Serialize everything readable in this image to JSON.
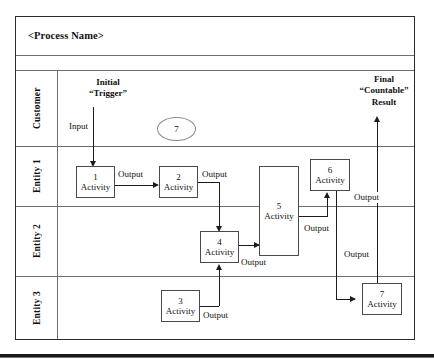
{
  "diagram": {
    "title": "<Process Name>",
    "type": "swimlane-process-flow"
  },
  "lanes": [
    {
      "id": "customer",
      "label": "Customer"
    },
    {
      "id": "entity1",
      "label": "Entity 1"
    },
    {
      "id": "entity2",
      "label": "Entity 2"
    },
    {
      "id": "entity3",
      "label": "Entity 3"
    }
  ],
  "annotations": {
    "initial_trigger_line1": "Initial",
    "initial_trigger_line2": "“Trigger”",
    "final_result_line1": "Final",
    "final_result_line2": "“Countable”",
    "final_result_line3": "Result",
    "input_label": "Input",
    "marker_seven": "7"
  },
  "activities": [
    {
      "id": "a1",
      "number": "1",
      "label": "Activity",
      "lane": "entity1"
    },
    {
      "id": "a2",
      "number": "2",
      "label": "Activity",
      "lane": "entity1"
    },
    {
      "id": "a3",
      "number": "3",
      "label": "Activity",
      "lane": "entity3"
    },
    {
      "id": "a4",
      "number": "4",
      "label": "Activity",
      "lane": "entity2"
    },
    {
      "id": "a5",
      "number": "5",
      "label": "Activity",
      "lane": "entity1-entity2"
    },
    {
      "id": "a6",
      "number": "6",
      "label": "Activity",
      "lane": "entity1"
    },
    {
      "id": "a7",
      "number": "7",
      "label": "Activity",
      "lane": "entity3"
    }
  ],
  "flow_labels": {
    "output_1_to_2": "Output",
    "output_2_to_4": "Output",
    "output_4_to_5": "Output",
    "output_5_to_6": "Output",
    "output_6_right": "Output",
    "output_6_to_7": "Output",
    "output_3_to_4": "Output"
  },
  "colors": {
    "frame": "#2b2b2b",
    "lane_divider": "#6e6e6e",
    "box_border": "#4a4a4a",
    "connector": "#1c1c1c",
    "background": "#ffffff",
    "text": "#111111"
  }
}
